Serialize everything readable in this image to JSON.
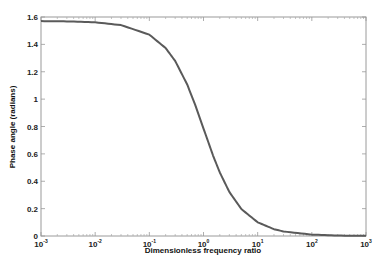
{
  "chart_data": {
    "type": "line",
    "title": "",
    "xlabel": "Dimensionless frequency ratio",
    "ylabel": "Phase angle (radians)",
    "xscale": "log",
    "xlim": [
      0.001,
      1000
    ],
    "ylim": [
      0,
      1.6
    ],
    "grid": false,
    "legend": null,
    "x_ticks": [
      {
        "base": "10",
        "exp": "-3",
        "value": 0.001
      },
      {
        "base": "10",
        "exp": "-2",
        "value": 0.01
      },
      {
        "base": "10",
        "exp": "-1",
        "value": 0.1
      },
      {
        "base": "10",
        "exp": "0",
        "value": 1
      },
      {
        "base": "10",
        "exp": "1",
        "value": 10
      },
      {
        "base": "10",
        "exp": "2",
        "value": 100
      },
      {
        "base": "10",
        "exp": "3",
        "value": 1000
      }
    ],
    "y_ticks": [
      "0",
      "0.2",
      "0.4",
      "0.6",
      "0.8",
      "1",
      "1.2",
      "1.4",
      "1.6"
    ],
    "series": [
      {
        "name": "phase",
        "color": "#5a5a5a",
        "x": [
          0.001,
          0.003,
          0.01,
          0.03,
          0.1,
          0.2,
          0.3,
          0.5,
          0.7,
          1,
          1.5,
          2,
          3,
          5,
          10,
          20,
          30,
          100,
          300,
          1000
        ],
        "y": [
          1.57,
          1.568,
          1.561,
          1.541,
          1.471,
          1.373,
          1.279,
          1.107,
          0.96,
          0.785,
          0.588,
          0.464,
          0.322,
          0.197,
          0.1,
          0.05,
          0.033,
          0.01,
          0.003,
          0.001
        ]
      }
    ]
  },
  "colors": {
    "background": "#ffffff",
    "axes": "#999999",
    "curve": "#5a5a5a",
    "text": "#222222"
  }
}
